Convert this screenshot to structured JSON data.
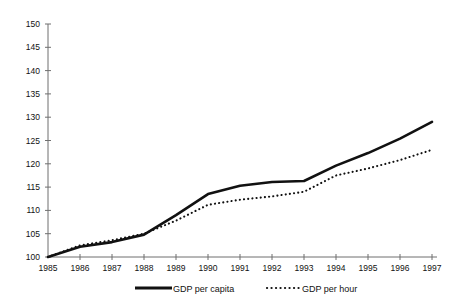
{
  "chart_data": {
    "type": "line",
    "title": "",
    "xlabel": "",
    "ylabel": "",
    "grid": false,
    "legend_position": "bottom",
    "x": [
      1985,
      1986,
      1987,
      1988,
      1989,
      1990,
      1991,
      1992,
      1993,
      1994,
      1995,
      1996,
      1997
    ],
    "xtick_labels": [
      "1985",
      "1986",
      "1987",
      "1988",
      "1989",
      "1990",
      "1991",
      "1992",
      "1993",
      "1994",
      "1995",
      "1996",
      "1997"
    ],
    "ytick_labels": [
      "100",
      "105",
      "110",
      "115",
      "120",
      "125",
      "130",
      "135",
      "140",
      "145",
      "150"
    ],
    "yticks": [
      100,
      105,
      110,
      115,
      120,
      125,
      130,
      135,
      140,
      145,
      150
    ],
    "ylim": [
      100,
      150
    ],
    "xlim": [
      1985,
      1997
    ],
    "series": [
      {
        "name": "GDP per capita",
        "style": "solid",
        "values": [
          100.0,
          102.2,
          103.2,
          104.8,
          109.0,
          113.5,
          115.3,
          116.1,
          116.3,
          119.6,
          122.3,
          125.4,
          129.0
        ]
      },
      {
        "name": "GDP per hour",
        "style": "dotted",
        "values": [
          100.0,
          102.5,
          103.6,
          105.0,
          107.8,
          111.2,
          112.3,
          113.0,
          114.0,
          117.5,
          119.0,
          120.8,
          123.0
        ]
      }
    ],
    "legend": [
      {
        "label": "GDP per capita",
        "style": "solid"
      },
      {
        "label": "GDP per hour",
        "style": "dotted"
      }
    ],
    "colors": {
      "series": "#111111",
      "axis": "#6f6f6f",
      "background": "#ffffff"
    }
  }
}
